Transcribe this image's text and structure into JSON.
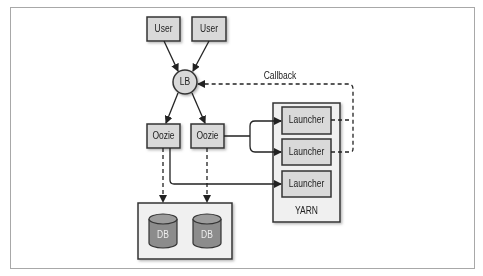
{
  "diagram": {
    "nodes": {
      "user1": {
        "label": "User"
      },
      "user2": {
        "label": "User"
      },
      "lb": {
        "label": "LB"
      },
      "oozie1": {
        "label": "Oozie"
      },
      "oozie2": {
        "label": "Oozie"
      },
      "launcher1": {
        "label": "Launcher"
      },
      "launcher2": {
        "label": "Launcher"
      },
      "launcher3": {
        "label": "Launcher"
      },
      "yarn": {
        "label": "YARN"
      },
      "db1": {
        "label": "DB"
      },
      "db2": {
        "label": "DB"
      }
    },
    "edges": {
      "callback": {
        "label": "Callback"
      }
    },
    "colors": {
      "box_fill": "#d9d9d9",
      "container_fill": "#f0f0f0",
      "db_fill": "#8c8c8c",
      "stroke": "#222222",
      "frame": "#a8a8a8"
    }
  }
}
